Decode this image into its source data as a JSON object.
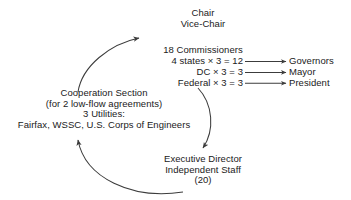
{
  "diagram": {
    "nodes": {
      "leadership": {
        "name": "chair-block",
        "lines": [
          "Chair",
          "Vice-Chair"
        ]
      },
      "commissioners": {
        "name": "commissioners-block",
        "heading": "18 Commissioners",
        "rows": [
          {
            "label": "4 states × 3 = 12",
            "appointer": "Governors"
          },
          {
            "label": "DC × 3 = 3",
            "appointer": "Mayor"
          },
          {
            "label": "Federal × 3 = 3",
            "appointer": "President"
          }
        ]
      },
      "cooperation": {
        "name": "cooperation-section-block",
        "lines": [
          "Cooperation Section",
          "(for 2 low-flow agreements)",
          "3 Utilities:",
          "Fairfax, WSSC, U.S. Corps of Engineers"
        ]
      },
      "executive": {
        "name": "executive-director-block",
        "lines": [
          "Executive Director",
          "Independent Staff",
          "(20)"
        ]
      }
    },
    "edges": [
      {
        "id": "cooperation-to-commissioners",
        "from": "cooperation",
        "to": "commissioners",
        "style": "curved",
        "direction": "up-right"
      },
      {
        "id": "commissioners-to-executive",
        "from": "commissioners",
        "to": "executive",
        "style": "curved",
        "direction": "down-left"
      },
      {
        "id": "executive-to-cooperation",
        "from": "executive",
        "to": "cooperation",
        "style": "curved",
        "direction": "left-up"
      },
      {
        "id": "states-to-governors",
        "from": "commissioners-row-0",
        "to": "Governors",
        "style": "straight",
        "direction": "right"
      },
      {
        "id": "dc-to-mayor",
        "from": "commissioners-row-1",
        "to": "Mayor",
        "style": "straight",
        "direction": "right"
      },
      {
        "id": "federal-to-president",
        "from": "commissioners-row-2",
        "to": "President",
        "style": "straight",
        "direction": "right"
      }
    ],
    "colors": {
      "background": "#ffffff",
      "text": "#1a1a1a",
      "stroke": "#3c3c3c"
    }
  }
}
